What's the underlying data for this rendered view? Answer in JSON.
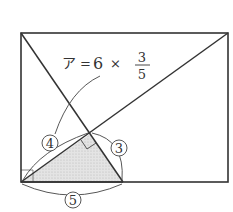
{
  "diagram": {
    "type": "geometry",
    "colors": {
      "stroke": "#333333",
      "shade": "#d9d9d9",
      "background": "#ffffff"
    },
    "formula": {
      "lhs": "ア",
      "equals": "=",
      "coef": "6",
      "times": "×",
      "numerator": "3",
      "denominator": "5"
    },
    "ratio_labels": {
      "hypotenuse_left": "4",
      "side_right": "3",
      "base": "5"
    }
  }
}
